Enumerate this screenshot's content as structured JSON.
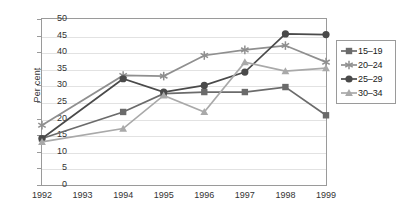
{
  "chart_data": {
    "type": "line",
    "title": "",
    "subtitle": "",
    "xlabel": "",
    "ylabel": "Per cent",
    "x": [
      "1992",
      "1993",
      "1994",
      "1995",
      "1996",
      "1997",
      "1998",
      "1999"
    ],
    "categories": [
      "1992",
      "1993",
      "1994",
      "1995",
      "1996",
      "1997",
      "1998",
      "1999"
    ],
    "xlim": [
      1992,
      1999
    ],
    "ylim": [
      0,
      50
    ],
    "yticks": [
      "0",
      "5",
      "10",
      "15",
      "20",
      "25",
      "30",
      "35",
      "40",
      "45",
      "50"
    ],
    "ytick_step": 5,
    "grid": "horizontal",
    "legend_position": "right",
    "series": [
      {
        "name": "15–19",
        "marker": "square",
        "color": "#6b6b6b",
        "values": [
          14,
          null,
          22,
          27.5,
          28,
          28,
          29.5,
          21
        ]
      },
      {
        "name": "20–24",
        "marker": "asterisk",
        "color": "#8f8f8f",
        "values": [
          18,
          null,
          33,
          32.8,
          39,
          40.7,
          42,
          37
        ]
      },
      {
        "name": "25–29",
        "marker": "circle",
        "color": "#4a4a4a",
        "values": [
          14,
          null,
          32,
          28,
          30,
          34,
          45.5,
          45.3
        ]
      },
      {
        "name": "30–34",
        "marker": "triangle",
        "color": "#a9a9a9",
        "values": [
          13,
          null,
          17,
          27,
          22,
          37,
          34.3,
          35.2
        ]
      }
    ]
  },
  "legend": {
    "items": [
      {
        "label": "15–19"
      },
      {
        "label": "20–24"
      },
      {
        "label": "25–29"
      },
      {
        "label": "30–34"
      }
    ]
  },
  "axes": {
    "y_title": "Per cent"
  }
}
